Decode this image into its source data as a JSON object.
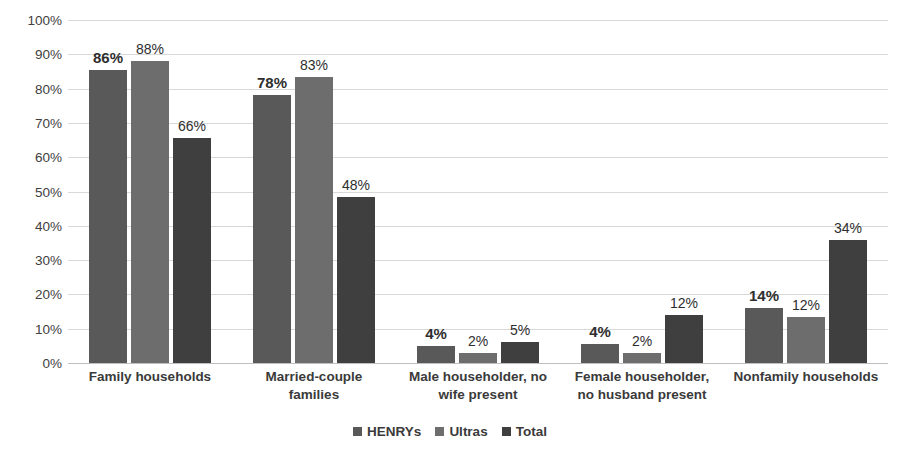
{
  "chart_data": {
    "type": "bar",
    "title": "",
    "subtitle": "",
    "xlabel": "",
    "ylabel": "",
    "ylim": [
      0,
      100
    ],
    "y_tick_labels": [
      "100%",
      "90%",
      "80%",
      "70%",
      "60%",
      "50%",
      "40%",
      "30%",
      "20%",
      "10%",
      "0%"
    ],
    "y_tick_values": [
      100,
      90,
      80,
      70,
      60,
      50,
      40,
      30,
      20,
      10,
      0
    ],
    "grid": true,
    "legend_position": "bottom-center",
    "categories": [
      "Family households",
      "Married-couple families",
      "Male householder, no wife present",
      "Female householder, no husband present",
      "Nonfamily households"
    ],
    "category_lines": [
      [
        "Family households"
      ],
      [
        "Married-couple",
        "families"
      ],
      [
        "Male householder, no",
        "wife present"
      ],
      [
        "Female householder,",
        "no husband present"
      ],
      [
        "Nonfamily households"
      ]
    ],
    "series": [
      {
        "name": "HENRYs",
        "color": "#595959",
        "values": [
          86,
          78,
          4,
          4,
          14
        ],
        "plotted": [
          85.5,
          78,
          5,
          5.5,
          16
        ],
        "labels": [
          "86%",
          "78%",
          "4%",
          "4%",
          "14%"
        ],
        "label_emphasis": true
      },
      {
        "name": "Ultras",
        "color": "#6d6d6d",
        "values": [
          88,
          83,
          2,
          2,
          12
        ],
        "plotted": [
          88,
          83.5,
          3,
          3,
          13.5
        ],
        "labels": [
          "88%",
          "83%",
          "2%",
          "2%",
          "12%"
        ],
        "label_emphasis": false
      },
      {
        "name": "Total",
        "color": "#3f3f3f",
        "values": [
          66,
          48,
          5,
          12,
          34
        ],
        "plotted": [
          65.5,
          48.5,
          6,
          14,
          36
        ],
        "labels": [
          "66%",
          "48%",
          "5%",
          "12%",
          "34%"
        ],
        "label_emphasis": false
      }
    ]
  },
  "legend": {
    "items": [
      {
        "label": "HENRYs",
        "color": "#595959"
      },
      {
        "label": "Ultras",
        "color": "#6d6d6d"
      },
      {
        "label": "Total",
        "color": "#3f3f3f"
      }
    ]
  },
  "colors": {
    "henrys": "#595959",
    "ultras": "#6d6d6d",
    "total": "#3f3f3f",
    "gridline": "#d9d9d9",
    "axis_text": "#404040",
    "background": "#ffffff"
  }
}
